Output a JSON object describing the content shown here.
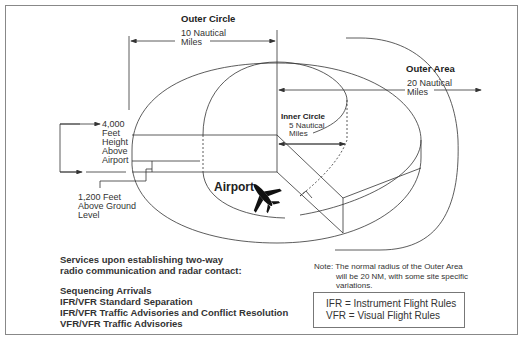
{
  "diagram": {
    "outer_circle": {
      "title": "Outer Circle",
      "radius_line1": "10 Nautical",
      "radius_line2": "Miles"
    },
    "outer_area": {
      "title": "Outer Area",
      "radius_line1": "20  Nautical",
      "radius_line2": "Miles"
    },
    "inner_circle": {
      "title": "Inner Circle",
      "radius_line1": "5 Nautical",
      "radius_line2": "Miles"
    },
    "height_label": [
      "4,000",
      "Feet",
      "Height",
      "Above",
      "Airport"
    ],
    "floor_label": [
      "1,200 Feet",
      "Above Ground",
      "Level"
    ],
    "airport_label": "Airport",
    "airport_icon": "airplane-icon"
  },
  "services": {
    "intro_line1": "Services upon establishing two-way",
    "intro_line2": "radio communication and radar contact:",
    "items": [
      "Sequencing Arrivals",
      "IFR/VFR Standard Separation",
      "IFR/VFR Traffic Advisories and Conflict Resolution",
      "VFR/VFR Traffic Advisories"
    ]
  },
  "note": {
    "line1": "Note: The normal radius of the Outer Area",
    "line2": "will be 20 NM, with some site specific",
    "line3": "variations."
  },
  "legend": {
    "ifr": "IFR = Instrument Flight Rules",
    "vfr": "VFR = Visual Flight Rules"
  },
  "colors": {
    "line": "#333333",
    "border": "#888888",
    "background": "#ffffff"
  }
}
